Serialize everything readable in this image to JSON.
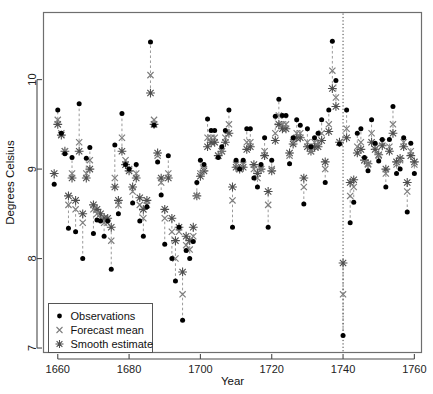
{
  "chart_data": {
    "type": "scatter",
    "title": "",
    "subtitle": "",
    "xlabel": "Year",
    "ylabel": "Degrees Celsius",
    "xlim": [
      1656,
      1762
    ],
    "ylim": [
      6.95,
      10.75
    ],
    "xticks": [
      1660,
      1680,
      1700,
      1720,
      1740,
      1760
    ],
    "yticks": [
      7,
      8,
      9,
      10
    ],
    "grid": false,
    "legend_position": "bottom-left",
    "legend": [
      {
        "label": "Observations",
        "marker": "filled-circle",
        "color": "#000000"
      },
      {
        "label": "Forecast mean",
        "marker": "cross-x",
        "color": "#808080"
      },
      {
        "label": "Smooth estimate",
        "marker": "asterisk-star",
        "color": "#555555"
      }
    ],
    "annotations": [
      {
        "type": "vertical-dotted-line",
        "x": 1740,
        "label": "forecast-origin"
      }
    ],
    "connector_style": "dashed-vertical",
    "x": [
      1659,
      1660,
      1661,
      1662,
      1663,
      1664,
      1665,
      1666,
      1667,
      1668,
      1669,
      1670,
      1671,
      1672,
      1673,
      1674,
      1675,
      1676,
      1677,
      1678,
      1679,
      1680,
      1681,
      1682,
      1683,
      1684,
      1685,
      1686,
      1687,
      1688,
      1689,
      1690,
      1691,
      1692,
      1693,
      1694,
      1695,
      1696,
      1697,
      1698,
      1699,
      1700,
      1701,
      1702,
      1703,
      1704,
      1705,
      1706,
      1707,
      1708,
      1709,
      1710,
      1711,
      1712,
      1713,
      1714,
      1715,
      1716,
      1717,
      1718,
      1719,
      1720,
      1721,
      1722,
      1723,
      1724,
      1725,
      1726,
      1727,
      1728,
      1729,
      1730,
      1731,
      1732,
      1733,
      1734,
      1735,
      1736,
      1737,
      1738,
      1739,
      1740,
      1741,
      1742,
      1743,
      1744,
      1745,
      1746,
      1747,
      1748,
      1749,
      1750,
      1751,
      1752,
      1753,
      1754,
      1755,
      1756,
      1757,
      1758,
      1759,
      1760
    ],
    "series": [
      {
        "name": "Observations",
        "marker": "filled-circle",
        "color": "#000000",
        "values": [
          8.83,
          9.66,
          9.4,
          9.17,
          8.34,
          9.13,
          8.3,
          9.73,
          8.0,
          9.12,
          9.24,
          8.28,
          8.43,
          8.42,
          8.25,
          8.42,
          7.88,
          9.27,
          8.5,
          9.62,
          9.05,
          9.0,
          8.62,
          9.05,
          8.42,
          8.25,
          8.58,
          10.42,
          9.49,
          9.08,
          8.71,
          8.16,
          9.15,
          8.0,
          7.75,
          8.35,
          7.31,
          8.09,
          8.0,
          8.19,
          8.85,
          9.1,
          9.05,
          9.56,
          9.43,
          9.43,
          9.13,
          9.25,
          9.43,
          9.66,
          8.35,
          9.1,
          9.0,
          9.1,
          9.45,
          9.45,
          8.9,
          8.8,
          9.05,
          9.35,
          8.35,
          9.1,
          9.59,
          9.78,
          9.6,
          9.6,
          9.06,
          9.35,
          9.55,
          9.49,
          8.61,
          9.45,
          9.25,
          9.35,
          9.4,
          9.55,
          8.85,
          9.66,
          10.43,
          9.99,
          9.28,
          7.14,
          9.66,
          8.4,
          8.63,
          9.4,
          9.45,
          9.13,
          8.98,
          9.55,
          9.29,
          9.09,
          9.33,
          8.8,
          9.33,
          9.7,
          8.95,
          9.0,
          9.35,
          8.52,
          9.29,
          8.95
        ]
      },
      {
        "name": "Forecast mean",
        "marker": "cross-x",
        "color": "#7d7d7d",
        "values": [
          null,
          9.55,
          9.4,
          9.2,
          8.6,
          8.95,
          8.55,
          9.3,
          8.4,
          8.95,
          9.1,
          8.55,
          8.5,
          8.45,
          8.4,
          8.4,
          8.2,
          8.9,
          8.6,
          9.35,
          9.1,
          9.0,
          8.75,
          8.95,
          8.6,
          8.45,
          8.6,
          10.05,
          9.55,
          9.15,
          8.85,
          8.45,
          8.95,
          8.3,
          8.0,
          8.3,
          7.6,
          8.15,
          8.1,
          8.25,
          8.7,
          8.95,
          9.0,
          9.35,
          9.35,
          9.35,
          9.15,
          9.2,
          9.35,
          9.5,
          8.65,
          9.05,
          9.0,
          9.05,
          9.3,
          9.3,
          9.0,
          8.9,
          9.0,
          9.2,
          8.6,
          9.0,
          9.4,
          9.6,
          9.5,
          9.5,
          9.15,
          9.3,
          9.4,
          9.4,
          8.8,
          9.3,
          9.2,
          9.3,
          9.3,
          9.4,
          9.0,
          9.5,
          10.1,
          9.8,
          9.3,
          7.6,
          9.45,
          8.7,
          8.8,
          9.25,
          9.3,
          9.1,
          9.05,
          9.4,
          9.25,
          9.15,
          9.3,
          8.95,
          9.25,
          9.5,
          9.05,
          9.1,
          9.3,
          8.75,
          9.2,
          9.05
        ]
      },
      {
        "name": "Smooth estimate",
        "marker": "asterisk-star",
        "color": "#4f4f4f",
        "values": [
          8.95,
          9.5,
          9.38,
          9.2,
          8.7,
          8.9,
          8.65,
          9.2,
          8.5,
          8.9,
          9.0,
          8.6,
          8.55,
          8.5,
          8.45,
          8.45,
          8.35,
          8.8,
          8.65,
          9.2,
          9.05,
          8.98,
          8.8,
          8.9,
          8.68,
          8.55,
          8.65,
          9.85,
          9.5,
          9.18,
          8.9,
          8.55,
          8.9,
          8.45,
          8.2,
          8.35,
          7.85,
          8.25,
          8.2,
          8.35,
          8.7,
          8.92,
          8.98,
          9.25,
          9.3,
          9.3,
          9.15,
          9.2,
          9.3,
          9.4,
          8.8,
          9.02,
          9.0,
          9.02,
          9.22,
          9.25,
          9.05,
          8.95,
          9.0,
          9.15,
          8.75,
          8.98,
          9.32,
          9.5,
          9.45,
          9.45,
          9.18,
          9.28,
          9.35,
          9.35,
          8.9,
          9.25,
          9.2,
          9.25,
          9.25,
          9.32,
          9.08,
          9.42,
          9.9,
          9.7,
          9.3,
          7.95,
          9.35,
          8.85,
          8.88,
          9.18,
          9.22,
          9.1,
          9.06,
          9.3,
          9.22,
          9.16,
          9.26,
          9.0,
          9.2,
          9.4,
          9.08,
          9.12,
          9.25,
          8.85,
          9.15,
          9.08
        ]
      }
    ]
  },
  "axes": {
    "y_title": "Degrees Celsius",
    "x_title": "Year",
    "x_tick_labels": [
      "1660",
      "1680",
      "1700",
      "1720",
      "1740",
      "1760"
    ],
    "y_tick_labels": [
      "7",
      "8",
      "9",
      "10"
    ]
  },
  "legend": {
    "items": [
      {
        "label": "Observations"
      },
      {
        "label": "Forecast mean"
      },
      {
        "label": "Smooth estimate"
      }
    ]
  }
}
